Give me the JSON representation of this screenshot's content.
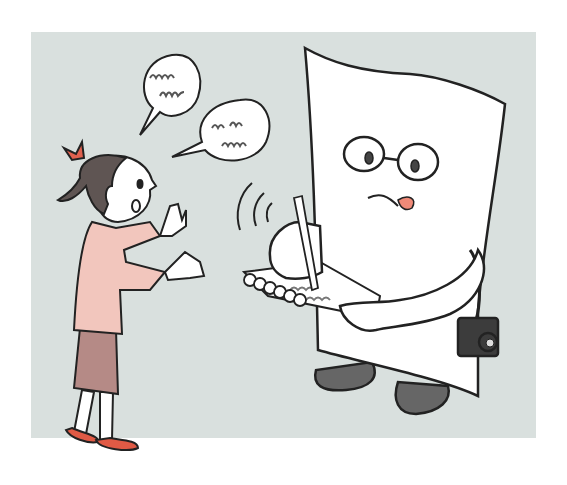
{
  "scene": {
    "title": "Girl talking to a paper character taking notes",
    "background_color": "#d9e0de",
    "page_color": "#ffffff"
  },
  "girl": {
    "hair_color": "#5f5553",
    "ribbon_color": "#e0614f",
    "shirt_color": "#f2c6bd",
    "skirt_color": "#b58a86",
    "shoe_color": "#e05a45",
    "skin_color": "#ffffff"
  },
  "paper_character": {
    "body_color": "#ffffff",
    "tongue_color": "#f08a78",
    "shoe_color": "#666666",
    "camera_color": "#3c3c3c",
    "notepad_scribble_color": "#777777"
  },
  "speech_bubbles": [
    {
      "id": "bubble-1",
      "content": "scribble"
    },
    {
      "id": "bubble-2",
      "content": "scribble"
    }
  ],
  "outline_color": "#222222"
}
